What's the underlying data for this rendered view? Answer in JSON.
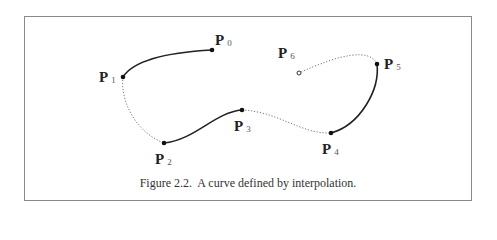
{
  "figure": {
    "caption": "Figure 2.2.  A curve defined by interpolation.",
    "points": [
      {
        "name": "P",
        "sub": "0",
        "x": 212,
        "y": 50,
        "marker": "filled"
      },
      {
        "name": "P",
        "sub": "1",
        "x": 123,
        "y": 77,
        "marker": "filled"
      },
      {
        "name": "P",
        "sub": "2",
        "x": 164,
        "y": 143,
        "marker": "filled"
      },
      {
        "name": "P",
        "sub": "3",
        "x": 242,
        "y": 110,
        "marker": "filled"
      },
      {
        "name": "P",
        "sub": "4",
        "x": 331,
        "y": 133,
        "marker": "filled"
      },
      {
        "name": "P",
        "sub": "5",
        "x": 377,
        "y": 64,
        "marker": "filled"
      },
      {
        "name": "P",
        "sub": "6",
        "x": 299,
        "y": 73,
        "marker": "hollow"
      }
    ],
    "segments": [
      {
        "from": "P0",
        "to": "P1",
        "style": "solid"
      },
      {
        "from": "P1",
        "to": "P2",
        "style": "dotted"
      },
      {
        "from": "P2",
        "to": "P3",
        "style": "solid"
      },
      {
        "from": "P3",
        "to": "P4",
        "style": "dotted"
      },
      {
        "from": "P4",
        "to": "P5",
        "style": "solid"
      },
      {
        "from": "P5",
        "to": "P6",
        "style": "dotted"
      }
    ],
    "colors": {
      "solid_curve": "#222222",
      "dotted_curve": "#777777",
      "frame": "#8a8a8a"
    }
  }
}
